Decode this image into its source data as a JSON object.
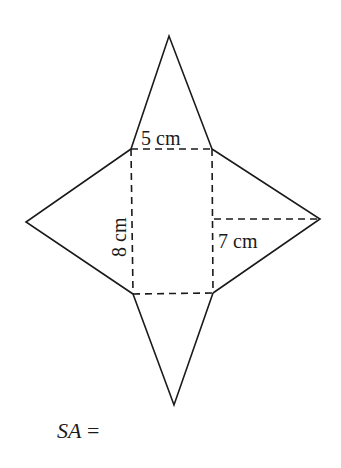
{
  "diagram": {
    "labels": {
      "base_side": "5 cm",
      "base_other_side": "8 cm",
      "slant_height": "7 cm"
    },
    "prompt": {
      "variable": "SA",
      "equals": "="
    }
  }
}
